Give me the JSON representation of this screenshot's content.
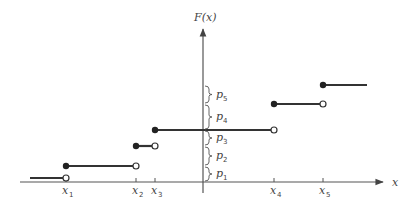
{
  "diagram": {
    "type": "step-function-cdf",
    "y_axis_label": "F(x)",
    "x_axis_label": "x",
    "x_ticks": [
      {
        "name": "x",
        "sub": "1",
        "px": 66
      },
      {
        "name": "x",
        "sub": "2",
        "px": 136
      },
      {
        "name": "x",
        "sub": "3",
        "px": 155
      },
      {
        "name": "x",
        "sub": "4",
        "px": 274
      },
      {
        "name": "x",
        "sub": "5",
        "px": 323
      }
    ],
    "levels": [
      {
        "from_px": 30,
        "to_px": 66,
        "y_px": 178,
        "left_closed": false,
        "right_open": true
      },
      {
        "from_px": 66,
        "to_px": 136,
        "y_px": 166,
        "left_closed": true,
        "right_open": true
      },
      {
        "from_px": 136,
        "to_px": 155,
        "y_px": 146,
        "left_closed": true,
        "right_open": true
      },
      {
        "from_px": 155,
        "to_px": 274,
        "y_px": 130,
        "left_closed": true,
        "right_open": true
      },
      {
        "from_px": 274,
        "to_px": 323,
        "y_px": 104,
        "left_closed": true,
        "right_open": true
      },
      {
        "from_px": 323,
        "to_px": 367,
        "y_px": 85,
        "left_closed": true,
        "right_open": false
      }
    ],
    "jump_labels": [
      {
        "name": "p",
        "sub": "1",
        "y_top": 166,
        "y_bot": 182
      },
      {
        "name": "p",
        "sub": "2",
        "y_top": 146,
        "y_bot": 166
      },
      {
        "name": "p",
        "sub": "3",
        "y_top": 130,
        "y_bot": 146
      },
      {
        "name": "p",
        "sub": "4",
        "y_top": 104,
        "y_bot": 130
      },
      {
        "name": "p",
        "sub": "5",
        "y_top": 85,
        "y_bot": 104
      }
    ]
  }
}
